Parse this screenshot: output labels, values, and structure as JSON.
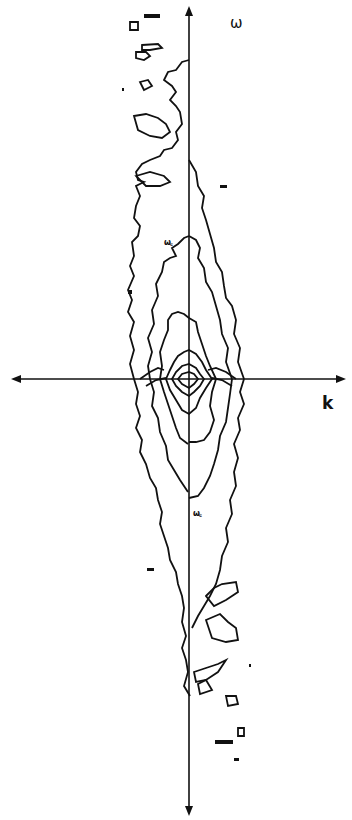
{
  "figure": {
    "type": "contour",
    "axes": {
      "vertical_label": "ω",
      "horizontal_label": "k"
    },
    "markers": {
      "upper": "ω꜀",
      "lower": "ω꜀"
    },
    "colors": {
      "ink": "#111111",
      "background": "#ffffff"
    }
  }
}
